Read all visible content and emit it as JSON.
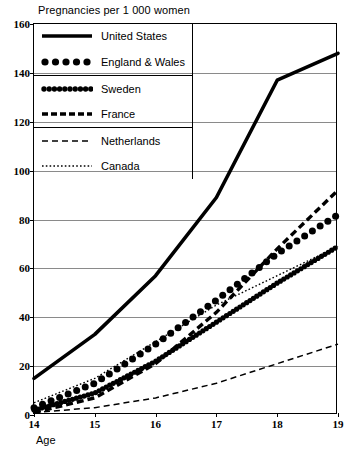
{
  "chart_data": {
    "type": "line",
    "title": "Pregnancies per 1 000 women",
    "xlabel": "Age",
    "ylabel": "",
    "xlim": [
      14,
      19
    ],
    "ylim": [
      0,
      160
    ],
    "grid": true,
    "legend_position": "top-left",
    "x": [
      14,
      15,
      16,
      17,
      18,
      19
    ],
    "xticks": [
      "14",
      "15",
      "16",
      "17",
      "18",
      "19"
    ],
    "yticks": [
      "0",
      "20",
      "40",
      "60",
      "80",
      "100",
      "120",
      "140",
      "160"
    ],
    "ytick_values": [
      0,
      20,
      40,
      60,
      80,
      100,
      120,
      140,
      160
    ],
    "series": [
      {
        "name": "United States",
        "style": "solid-thick",
        "values": [
          15,
          33,
          57,
          89,
          137,
          148
        ]
      },
      {
        "name": "England & Wales",
        "style": "large-dots",
        "values": [
          3,
          13,
          29,
          47,
          66,
          82
        ]
      },
      {
        "name": "Sweden",
        "style": "small-dots-thick",
        "values": [
          2,
          9,
          22,
          38,
          54,
          69
        ]
      },
      {
        "name": "France",
        "style": "thick-dashed",
        "values": [
          1,
          7,
          21,
          42,
          68,
          92
        ]
      },
      {
        "name": "Netherlands",
        "style": "thin-dashed",
        "values": [
          1,
          3,
          7,
          13,
          21,
          29
        ]
      },
      {
        "name": "Canada",
        "style": "dotted",
        "values": [
          5,
          15,
          30,
          45,
          57,
          69
        ]
      }
    ]
  },
  "legend": {
    "items": [
      {
        "label": "United States",
        "swatch": "solid-thick-swatch"
      },
      {
        "label": "England & Wales",
        "swatch": "large-dots-swatch"
      },
      {
        "label": "Sweden",
        "swatch": "small-dots-thick-swatch"
      },
      {
        "label": "France",
        "swatch": "thick-dashed-swatch"
      },
      {
        "label": "Netherlands",
        "swatch": "thin-dashed-swatch"
      },
      {
        "label": "Canada",
        "swatch": "dotted-swatch"
      }
    ]
  }
}
